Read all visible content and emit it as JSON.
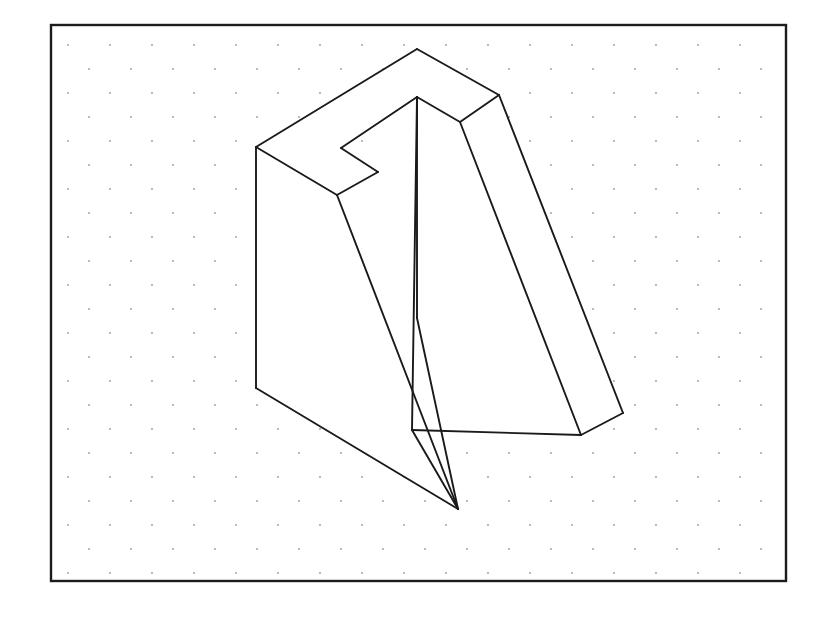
{
  "page": {
    "width": 826,
    "height": 623,
    "background_color": "#ffffff"
  },
  "frame": {
    "name": "drawing-border",
    "x": 51,
    "y": 25,
    "width": 735,
    "height": 556,
    "stroke_color": "#1c1c1c",
    "stroke_width": 2.4,
    "fill": "none"
  },
  "grid": {
    "name": "isometric-dot-grid",
    "dot_color": "#9a9a9a",
    "dot_radius": 0.9,
    "col_spacing": 42,
    "row_spacing": 24,
    "stagger_offset": 21,
    "origin_x": 68,
    "origin_y": 45,
    "cols": 18,
    "rows": 23
  },
  "figure": {
    "name": "impossible-fork-solid",
    "stroke_color": "#1a1a1a",
    "fill_color": "#ffffff",
    "stroke_width": 1.9,
    "vertices": {
      "top_apex": [
        417,
        49
      ],
      "top_left": [
        256,
        147
      ],
      "top_right": [
        499,
        95
      ],
      "inner_peak": [
        417,
        97
      ],
      "slot_inner_left": [
        341,
        148
      ],
      "slot_notch": [
        378,
        172
      ],
      "slab_front_corner": [
        337,
        195
      ],
      "right_junction": [
        460,
        122
      ],
      "left_bottom": [
        256,
        388
      ],
      "left_prong_bottom": [
        458,
        509
      ],
      "mid_valley": [
        412,
        430
      ],
      "right_prong_bottom": [
        581,
        435
      ],
      "right_prong_outer": [
        623,
        413
      ],
      "mid_vertical_bottom": [
        417,
        318
      ]
    },
    "faces": [
      {
        "name": "top-face-back-slab",
        "points": "256,147 417,49 499,95 460,122 417,97 341,148 378,172 337,195"
      },
      {
        "name": "left-face-back-slab",
        "points": "256,147 337,195 458,509 256,388"
      },
      {
        "name": "left-prong-front-face",
        "points": "337,195 417,97 417,318 458,509"
      },
      {
        "name": "right-prong-top-face",
        "points": "417,97 460,122 581,435 412,430"
      },
      {
        "name": "right-prong-side-face",
        "points": "460,122 499,95 623,413 581,435"
      }
    ],
    "edges": [
      {
        "name": "edge-top-left-ridge",
        "path": "M256,147 L417,49"
      },
      {
        "name": "edge-top-right-ridge",
        "path": "M417,49 L499,95"
      },
      {
        "name": "edge-right-upper-bevel",
        "path": "M499,95 L460,122"
      },
      {
        "name": "edge-inner-bevel-to-peak",
        "path": "M460,122 L417,97"
      },
      {
        "name": "edge-peak-to-slot",
        "path": "M417,97 L341,148"
      },
      {
        "name": "edge-slot-floor",
        "path": "M341,148 L378,172"
      },
      {
        "name": "edge-slot-to-front-corner",
        "path": "M378,172 L337,195"
      },
      {
        "name": "edge-front-corner-to-left-top",
        "path": "M337,195 L256,147"
      },
      {
        "name": "edge-left-vertical",
        "path": "M256,147 L256,388"
      },
      {
        "name": "edge-left-bottom-diagonal",
        "path": "M256,388 L458,509"
      },
      {
        "name": "edge-left-prong-inner",
        "path": "M337,195 L458,509"
      },
      {
        "name": "edge-mid-vertical",
        "path": "M417,97 L417,318"
      },
      {
        "name": "edge-mid-vertical-lower",
        "path": "M417,318 L458,509"
      },
      {
        "name": "edge-mid-prong-right",
        "path": "M417,97 L412,430"
      },
      {
        "name": "edge-valley-to-right-bottom",
        "path": "M412,430 L581,435"
      },
      {
        "name": "edge-right-prong-left",
        "path": "M460,122 L581,435"
      },
      {
        "name": "edge-right-prong-right",
        "path": "M499,95 L623,413"
      },
      {
        "name": "edge-right-prong-base",
        "path": "M623,413 L581,435"
      },
      {
        "name": "edge-left-prong-bottom-tip",
        "path": "M458,509 L412,430"
      }
    ]
  }
}
